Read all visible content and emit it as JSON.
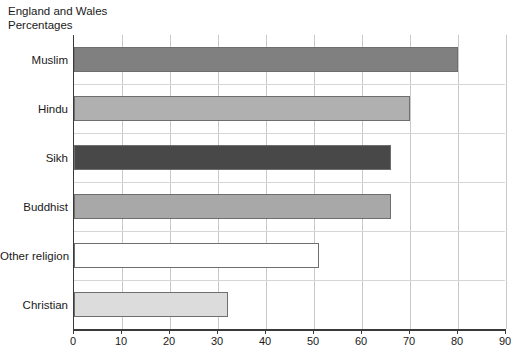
{
  "chart_data": {
    "type": "bar",
    "orientation": "horizontal",
    "title": "England and Wales",
    "subtitle": "Percentages",
    "xlabel": "",
    "ylabel": "",
    "xlim": [
      0,
      90
    ],
    "xticks": [
      0,
      10,
      20,
      30,
      40,
      50,
      60,
      70,
      80,
      90
    ],
    "grid": "vertical",
    "legend": "none",
    "categories": [
      "Muslim",
      "Hindu",
      "Sikh",
      "Buddhist",
      "Other religion",
      "Christian"
    ],
    "values": [
      80,
      70,
      66,
      66,
      51,
      32
    ],
    "bar_colors": [
      "#808080",
      "#b0b0b0",
      "#484848",
      "#a8a8a8",
      "#ffffff",
      "#dcdcdc"
    ],
    "bar_edge_color": "#6e6e6e",
    "bars": [
      {
        "label": "Muslim",
        "value": 80,
        "color": "#808080"
      },
      {
        "label": "Hindu",
        "value": 70,
        "color": "#b0b0b0"
      },
      {
        "label": "Sikh",
        "value": 66,
        "color": "#484848"
      },
      {
        "label": "Buddhist",
        "value": 66,
        "color": "#a8a8a8"
      },
      {
        "label": "Other religion",
        "value": 51,
        "color": "#ffffff"
      },
      {
        "label": "Christian",
        "value": 32,
        "color": "#dcdcdc"
      }
    ]
  },
  "header": {
    "title": "England and Wales",
    "subtitle": "Percentages"
  },
  "axis": {
    "x_tick_labels": [
      "0",
      "10",
      "20",
      "30",
      "40",
      "50",
      "60",
      "70",
      "80",
      "90"
    ]
  },
  "style": {
    "gridline_color": "#c9c9c9",
    "axis_color": "#3a3a3a",
    "rowline_color": "#d6d6d6",
    "text_color": "#1a1a1a",
    "background": "#ffffff"
  }
}
